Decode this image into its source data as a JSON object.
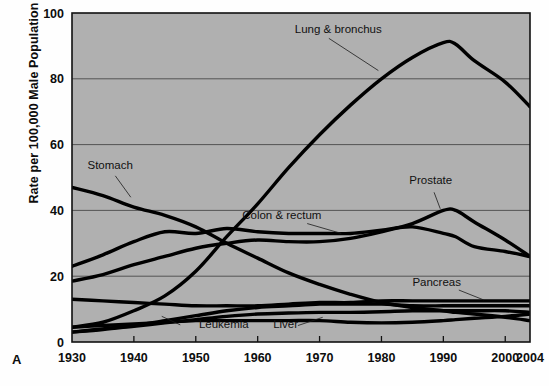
{
  "figure": {
    "panel_label": "A",
    "y_axis_title": "Rate per 100,000 Male Population"
  },
  "chart_data": {
    "type": "line",
    "title": "",
    "xlabel": "",
    "ylabel": "Rate per 100,000 Male Population",
    "xlim": [
      1930,
      2004
    ],
    "ylim": [
      0,
      100
    ],
    "grid": true,
    "legend_position": "inline-annotations",
    "x_ticks": [
      "1930",
      "1940",
      "1950",
      "1960",
      "1970",
      "1980",
      "1990",
      "2000",
      "2004"
    ],
    "x_tick_values": [
      1930,
      1940,
      1950,
      1960,
      1970,
      1980,
      1990,
      2000,
      2004
    ],
    "y_ticks": [
      "0",
      "20",
      "40",
      "60",
      "80",
      "100"
    ],
    "y_tick_values": [
      0,
      20,
      40,
      60,
      80,
      100
    ],
    "x": [
      1930,
      1935,
      1940,
      1945,
      1950,
      1955,
      1960,
      1965,
      1970,
      1975,
      1980,
      1985,
      1990,
      1992,
      1995,
      2000,
      2004
    ],
    "series": [
      {
        "name": "Lung & bronchus",
        "label": "Lung & bronchus",
        "label_x": 1966,
        "label_y": 94,
        "leader_from": [
          1971.5,
          92.3
        ],
        "leader_to": [
          1979.5,
          82.5
        ],
        "values": [
          4.5,
          6.0,
          9.5,
          14.0,
          21.5,
          32.0,
          42.0,
          53.0,
          63.0,
          72.0,
          80.0,
          86.5,
          91.0,
          90.5,
          85.5,
          79.0,
          71.5
        ]
      },
      {
        "name": "Stomach",
        "label": "Stomach",
        "label_x": 1932.5,
        "label_y": 52.5,
        "leader_from": [
          1937.0,
          50.5
        ],
        "leader_to": [
          1939.5,
          44.0
        ],
        "values": [
          47.0,
          44.5,
          41.0,
          38.5,
          35.0,
          30.0,
          25.5,
          21.0,
          17.5,
          14.5,
          12.0,
          10.5,
          9.5,
          9.0,
          8.5,
          7.5,
          6.5
        ]
      },
      {
        "name": "Colon & rectum",
        "label": "Colon & rectum",
        "label_x": 1957.5,
        "label_y": 37.5,
        "leader_from": [
          1968.0,
          36.0
        ],
        "leader_to": [
          1973.5,
          33.0
        ],
        "values": [
          23.0,
          26.5,
          30.5,
          33.5,
          33.0,
          34.5,
          33.5,
          33.0,
          33.0,
          33.0,
          34.0,
          35.0,
          33.0,
          32.0,
          29.0,
          27.5,
          26.0
        ]
      },
      {
        "name": "Prostate",
        "label": "Prostate",
        "label_x": 1984.5,
        "label_y": 48.0,
        "leader_from": [
          1988.5,
          45.5
        ],
        "leader_to": [
          1989.5,
          40.5
        ],
        "values": [
          18.5,
          20.5,
          23.5,
          26.0,
          28.5,
          30.0,
          31.0,
          30.5,
          30.5,
          31.5,
          33.5,
          36.0,
          40.0,
          40.0,
          36.5,
          31.0,
          26.0
        ]
      },
      {
        "name": "Pancreas",
        "label": "Pancreas",
        "label_x": 1985.0,
        "label_y": 17.0,
        "leader_from": [
          1992.5,
          15.8
        ],
        "leader_to": [
          1996.5,
          12.8
        ],
        "values": [
          3.0,
          4.0,
          5.0,
          6.5,
          8.0,
          9.5,
          10.5,
          11.0,
          11.5,
          11.5,
          11.5,
          11.0,
          11.0,
          11.0,
          11.0,
          11.0,
          11.0
        ]
      },
      {
        "name": "Leukemia",
        "label": "Leukemia",
        "label_x": 1950.5,
        "label_y": 4.2,
        "leader_from": [
          1947.5,
          5.2
        ],
        "leader_to": [
          1944.5,
          7.8
        ],
        "values": [
          3.0,
          3.8,
          4.8,
          5.8,
          6.8,
          7.8,
          8.5,
          8.8,
          9.0,
          9.0,
          9.2,
          9.5,
          9.5,
          9.5,
          9.5,
          9.5,
          9.0
        ]
      },
      {
        "name": "Liver",
        "label": "Liver",
        "label_x": 1962.5,
        "label_y": 4.2,
        "leader_from": [
          1966.5,
          5.0
        ],
        "leader_to": [
          1970.5,
          7.5
        ],
        "values": [
          4.5,
          5.0,
          5.5,
          6.0,
          6.5,
          6.5,
          6.5,
          6.5,
          6.5,
          6.0,
          5.8,
          6.0,
          6.5,
          6.8,
          7.2,
          7.8,
          8.5
        ]
      },
      {
        "name": "unlabeled-declining",
        "label": "",
        "values": [
          13.0,
          12.5,
          12.0,
          11.5,
          11.0,
          11.0,
          11.0,
          11.5,
          12.0,
          12.0,
          12.5,
          12.5,
          12.5,
          12.5,
          12.5,
          12.5,
          12.5
        ]
      }
    ]
  }
}
